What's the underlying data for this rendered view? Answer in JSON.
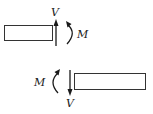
{
  "diagram": {
    "colors": {
      "stroke": "#1a1a1a",
      "beam_outline": "#333333",
      "background": "#ffffff"
    },
    "top_segment": {
      "shear_label": "V",
      "shear_direction": "up",
      "moment_label": "M",
      "moment_direction": "clockwise",
      "cut_face": "right"
    },
    "bottom_segment": {
      "shear_label": "V",
      "shear_direction": "down",
      "moment_label": "M",
      "moment_direction": "counterclockwise",
      "cut_face": "left"
    }
  }
}
